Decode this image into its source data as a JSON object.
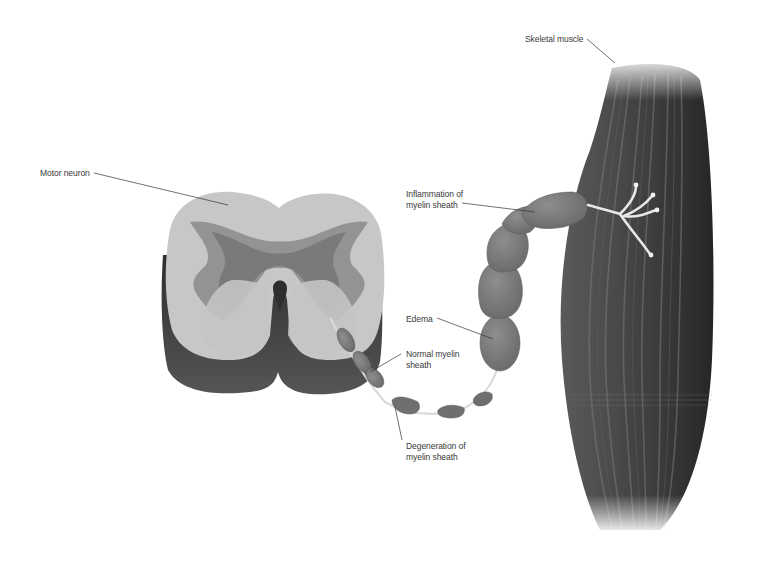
{
  "diagram": {
    "type": "anatomical-illustration",
    "background": "#ffffff",
    "colors": {
      "white_matter": "#c9c9c9",
      "gray_matter_outer": "#8f8f8f",
      "gray_matter_inner": "#767676",
      "cord_shadow": "#3a3a3a",
      "myelin_segment": "#7d7d7d",
      "muscle": "#3c3c3c",
      "nerve_ending": "#e6e6e6",
      "leader_line": "#333333",
      "label_text": "#3a3a3a"
    },
    "labels": {
      "motor_neuron": {
        "line1": "Motor neuron",
        "line2": ""
      },
      "skeletal_muscle": {
        "line1": "Skeletal muscle",
        "line2": ""
      },
      "inflammation": {
        "line1": "Inflammation of",
        "line2": "myelin sheath"
      },
      "edema": {
        "line1": "Edema",
        "line2": ""
      },
      "normal_myelin": {
        "line1": "Normal myelin",
        "line2": "sheath"
      },
      "degeneration": {
        "line1": "Degeneration of",
        "line2": "myelin sheath"
      }
    },
    "structures": [
      {
        "id": "spinal-cord-cross-section",
        "label_ref": "motor_neuron"
      },
      {
        "id": "normal-myelin-segments",
        "label_ref": "normal_myelin"
      },
      {
        "id": "degenerated-myelin-segments",
        "label_ref": "degeneration"
      },
      {
        "id": "edematous-myelin-segment",
        "label_ref": "edema"
      },
      {
        "id": "inflamed-myelin-segments",
        "label_ref": "inflammation"
      },
      {
        "id": "skeletal-muscle",
        "label_ref": "skeletal_muscle"
      },
      {
        "id": "neuromuscular-junction-terminals",
        "label_ref": null
      }
    ]
  }
}
